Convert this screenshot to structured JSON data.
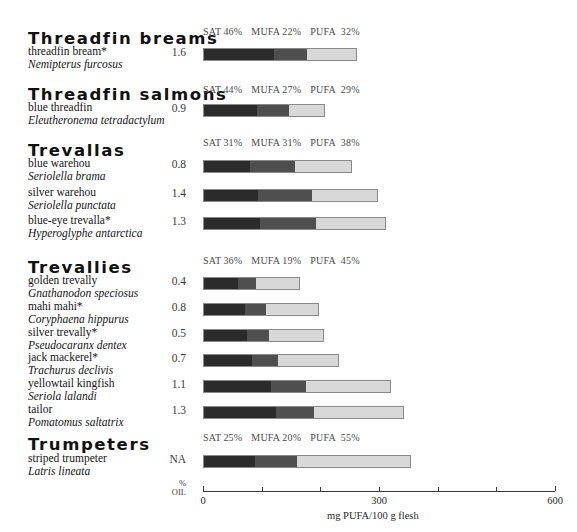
{
  "axis": {
    "title": "mg PUFA/100 g flesh",
    "ticks": [
      {
        "value": 0,
        "label": "0"
      },
      {
        "value": 100,
        "label": ""
      },
      {
        "value": 200,
        "label": ""
      },
      {
        "value": 300,
        "label": "300"
      },
      {
        "value": 400,
        "label": ""
      },
      {
        "value": 500,
        "label": ""
      },
      {
        "value": 600,
        "label": "600"
      }
    ],
    "min": 0,
    "max": 600
  },
  "oil_column": {
    "line1": "%",
    "line2": "OIL"
  },
  "legend_labels": {
    "sat": "SAT",
    "mufa": "MUFA",
    "pufa": "PUFA"
  },
  "colors": {
    "sat": "#2b2b2b",
    "mufa": "#4f4f4f",
    "pufa": "#d8d8d8",
    "bar_border": "#8a8a8a",
    "text": "#141414"
  },
  "groups": [
    {
      "heading": "Threadfin breams",
      "composition": {
        "sat": "46%",
        "mufa": "22%",
        "pufa": "32%"
      },
      "species": [
        {
          "common": "threadfin bream*",
          "scientific": "Nemipterus furcosus",
          "oil": "1.6",
          "pufa_mg": 262,
          "sat_pct": 46,
          "mufa_pct": 22,
          "pufa_pct": 32
        }
      ]
    },
    {
      "heading": "Threadfin salmons",
      "composition": {
        "sat": "44%",
        "mufa": "27%",
        "pufa": "29%"
      },
      "species": [
        {
          "common": "blue threadfin",
          "scientific": "Eleutheronema tetradactylum",
          "oil": "0.9",
          "pufa_mg": 208,
          "sat_pct": 44,
          "mufa_pct": 27,
          "pufa_pct": 29
        }
      ]
    },
    {
      "heading": "Trevallas",
      "composition": {
        "sat": "31%",
        "mufa": "31%",
        "pufa": "38%"
      },
      "species": [
        {
          "common": "blue warehou",
          "scientific": "Seriolella brama",
          "oil": "0.8",
          "pufa_mg": 254,
          "sat_pct": 31,
          "mufa_pct": 31,
          "pufa_pct": 38
        },
        {
          "common": "silver warehou",
          "scientific": "Seriolella punctata",
          "oil": "1.4",
          "pufa_mg": 299,
          "sat_pct": 31,
          "mufa_pct": 31,
          "pufa_pct": 38
        },
        {
          "common": "blue-eye trevalla*",
          "scientific": "Hyperoglyphe antarctica",
          "oil": "1.3",
          "pufa_mg": 312,
          "sat_pct": 31,
          "mufa_pct": 31,
          "pufa_pct": 38
        }
      ]
    },
    {
      "heading": "Trevallies",
      "composition": {
        "sat": "36%",
        "mufa": "19%",
        "pufa": "45%"
      },
      "species": [
        {
          "common": "golden trevally",
          "scientific": "Gnathanodon speciosus",
          "oil": "0.4",
          "pufa_mg": 165,
          "sat_pct": 36,
          "mufa_pct": 19,
          "pufa_pct": 45
        },
        {
          "common": "mahi mahi*",
          "scientific": "Coryphaena hippurus",
          "oil": "0.8",
          "pufa_mg": 197,
          "sat_pct": 36,
          "mufa_pct": 19,
          "pufa_pct": 45
        },
        {
          "common": "silver trevally*",
          "scientific": "Pseudocaranx dentex",
          "oil": "0.5",
          "pufa_mg": 206,
          "sat_pct": 36,
          "mufa_pct": 19,
          "pufa_pct": 45
        },
        {
          "common": "jack mackerel*",
          "scientific": "Trachurus declivis",
          "oil": "0.7",
          "pufa_mg": 232,
          "sat_pct": 36,
          "mufa_pct": 19,
          "pufa_pct": 45
        },
        {
          "common": "yellowtail kingfish",
          "scientific": "Seriola lalandi",
          "oil": "1.1",
          "pufa_mg": 320,
          "sat_pct": 36,
          "mufa_pct": 19,
          "pufa_pct": 45
        },
        {
          "common": "tailor",
          "scientific": "Pomatomus saltatrix",
          "oil": "1.3",
          "pufa_mg": 343,
          "sat_pct": 36,
          "mufa_pct": 19,
          "pufa_pct": 45
        }
      ]
    },
    {
      "heading": "Trumpeters",
      "composition": {
        "sat": "25%",
        "mufa": "20%",
        "pufa": "55%"
      },
      "species": [
        {
          "common": "striped trumpeter",
          "scientific": "Latris lineata",
          "oil": "NA",
          "pufa_mg": 354,
          "sat_pct": 25,
          "mufa_pct": 20,
          "pufa_pct": 55
        }
      ]
    }
  ],
  "chart_data": {
    "type": "bar",
    "title": "",
    "subtitle": "",
    "xlabel": "mg PUFA/100 g flesh",
    "ylabel": "",
    "xlim": [
      0,
      600
    ],
    "grid": false,
    "orientation": "horizontal",
    "stacked": true,
    "legend": [
      "SAT",
      "MUFA",
      "PUFA"
    ],
    "legend_position": "per-group-header",
    "note": "Each horizontal bar is stacked: SAT / MUFA / PUFA fractions of total fatty acids; total bar length equals mg PUFA/100 g flesh scaled on the x-axis. The '% OIL' column reports oil percentage per species.",
    "categories": [
      "threadfin bream*",
      "blue threadfin",
      "blue warehou",
      "silver warehou",
      "blue-eye trevalla*",
      "golden trevally",
      "mahi mahi*",
      "silver trevally*",
      "jack mackerel*",
      "yellowtail kingfish",
      "tailor",
      "striped trumpeter"
    ],
    "values": [
      262,
      208,
      254,
      299,
      312,
      165,
      197,
      206,
      232,
      320,
      343,
      354
    ],
    "oil_percent": [
      "1.6",
      "0.9",
      "0.8",
      "1.4",
      "1.3",
      "0.4",
      "0.8",
      "0.5",
      "0.7",
      "1.1",
      "1.3",
      "NA"
    ],
    "series": [
      {
        "name": "SAT",
        "values": [
          46,
          44,
          31,
          31,
          31,
          36,
          36,
          36,
          36,
          36,
          36,
          25
        ],
        "unit": "%"
      },
      {
        "name": "MUFA",
        "values": [
          22,
          27,
          31,
          31,
          31,
          19,
          19,
          19,
          19,
          19,
          19,
          20
        ],
        "unit": "%"
      },
      {
        "name": "PUFA",
        "values": [
          32,
          29,
          38,
          38,
          38,
          45,
          45,
          45,
          45,
          45,
          45,
          55
        ],
        "unit": "%"
      }
    ],
    "xticks": [
      0,
      100,
      200,
      300,
      400,
      500,
      600
    ],
    "xticklabels": [
      "0",
      "",
      "",
      "300",
      "",
      "",
      "600"
    ]
  }
}
